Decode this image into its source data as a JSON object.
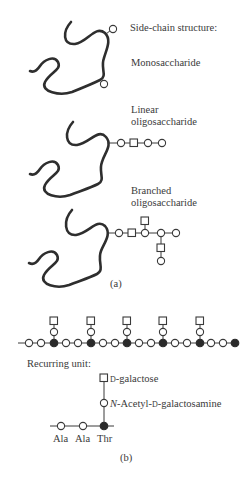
{
  "panel_a": {
    "heading": "Side-chain structure:",
    "items": [
      {
        "label_lines": [
          "Monosaccharide"
        ]
      },
      {
        "label_lines": [
          "Linear",
          "oligosaccharide"
        ]
      },
      {
        "label_lines": [
          "Branched",
          "oligosaccharide"
        ]
      }
    ],
    "caption": "(a)"
  },
  "panel_b": {
    "repeat_count": 5,
    "recurring_unit_label": "Recurring unit:",
    "unit_labels": {
      "square": "D-galactose",
      "square_prefix": "D",
      "square_suffix": "-galactose",
      "open_circle": "N-Acetyl-D-galactosamine",
      "open_circle_prefix": "N-Acetyl-",
      "open_circle_sc": "D",
      "open_circle_suffix": "-galactosamine"
    },
    "residues": [
      "Ala",
      "Ala",
      "Thr"
    ],
    "caption": "(b)"
  },
  "legend": {
    "open_circle": "sugar residue / amino acid",
    "square": "galactose residue",
    "filled_circle": "threonine with glycosylation site"
  }
}
